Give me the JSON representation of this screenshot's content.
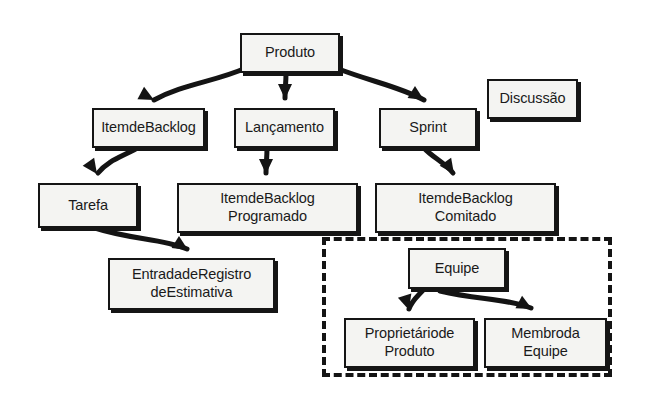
{
  "diagram": {
    "style": {
      "node_fill": "#f4f4f2",
      "node_border": "#151515",
      "arrow_color": "#141414",
      "group_border": "#141414",
      "background": "#ffffff"
    },
    "nodes": [
      {
        "id": "produto",
        "label": "Produto",
        "x": 240,
        "y": 33,
        "w": 100,
        "h": 40
      },
      {
        "id": "item-de-backlog",
        "label": "ItemdeBacklog",
        "x": 92,
        "y": 108,
        "w": 113,
        "h": 40
      },
      {
        "id": "lancamento",
        "label": "Lançamento",
        "x": 234,
        "y": 108,
        "w": 101,
        "h": 40
      },
      {
        "id": "sprint",
        "label": "Sprint",
        "x": 379,
        "y": 108,
        "w": 98,
        "h": 40
      },
      {
        "id": "discussao",
        "label": "Discussão",
        "x": 487,
        "y": 79,
        "w": 91,
        "h": 40
      },
      {
        "id": "tarefa",
        "label": "Tarefa",
        "x": 38,
        "y": 183,
        "w": 100,
        "h": 45
      },
      {
        "id": "item-programado",
        "label": "ItemdeBacklog\nProgramado",
        "x": 177,
        "y": 183,
        "w": 181,
        "h": 50
      },
      {
        "id": "item-comitado",
        "label": "ItemdeBacklog\nComitado",
        "x": 375,
        "y": 183,
        "w": 181,
        "h": 50
      },
      {
        "id": "entrada-estimativa",
        "label": "EntradadeRegistro\ndeEstimativa",
        "x": 108,
        "y": 258,
        "w": 167,
        "h": 52
      },
      {
        "id": "equipe",
        "label": "Equipe",
        "x": 408,
        "y": 248,
        "w": 98,
        "h": 41
      },
      {
        "id": "proprietario",
        "label": "Proprietáriode\nProduto",
        "x": 344,
        "y": 318,
        "w": 131,
        "h": 50
      },
      {
        "id": "membro",
        "label": "Membroda\nEquipe",
        "x": 484,
        "y": 318,
        "w": 123,
        "h": 50
      }
    ],
    "group": {
      "id": "equipe-group",
      "label": "",
      "x": 322,
      "y": 237,
      "w": 290,
      "h": 140,
      "dashed": true
    },
    "edges": [
      {
        "id": "produto-to-item-de-backlog",
        "from": "produto",
        "to": "item-de-backlog",
        "path": "M 246 68 C 214 82 183 84 154 100",
        "arrow_at": [
          154,
          100
        ],
        "arrow_angle": 28
      },
      {
        "id": "produto-to-lancamento",
        "from": "produto",
        "to": "lancamento",
        "path": "M 286 73 C 286 83 285 88 285 98",
        "arrow_at": [
          285,
          99
        ],
        "arrow_angle": 90
      },
      {
        "id": "produto-to-sprint",
        "from": "produto",
        "to": "sprint",
        "path": "M 336 68 C 372 82 398 86 424 100",
        "arrow_at": [
          424,
          100
        ],
        "arrow_angle": 32
      },
      {
        "id": "item-de-backlog-to-tarefa",
        "from": "item-de-backlog",
        "to": "tarefa",
        "path": "M 137 148 C 124 156 108 160 98 173",
        "arrow_at": [
          97,
          174
        ],
        "arrow_angle": 55
      },
      {
        "id": "lancamento-to-item-programado",
        "from": "lancamento",
        "to": "item-programado",
        "path": "M 267 148 C 267 158 266 164 266 173",
        "arrow_at": [
          266,
          174
        ],
        "arrow_angle": 90
      },
      {
        "id": "sprint-to-item-comitado",
        "from": "sprint",
        "to": "item-comitado",
        "path": "M 424 148 C 432 157 444 162 453 173",
        "arrow_at": [
          454,
          174
        ],
        "arrow_angle": 55
      },
      {
        "id": "tarefa-to-entrada-estimativa",
        "from": "tarefa",
        "to": "entrada-estimativa",
        "path": "M 95 228 C 132 240 161 238 187 249",
        "arrow_at": [
          188,
          250
        ],
        "arrow_angle": 32
      },
      {
        "id": "equipe-to-proprietario",
        "from": "equipe",
        "to": "proprietario",
        "path": "M 424 289 C 418 296 412 300 409 309",
        "arrow_at": [
          409,
          310
        ],
        "arrow_angle": 73
      },
      {
        "id": "equipe-to-membro",
        "from": "equipe",
        "to": "membro",
        "path": "M 440 291 C 478 300 505 298 531 308",
        "arrow_at": [
          532,
          309
        ],
        "arrow_angle": 28
      }
    ]
  }
}
